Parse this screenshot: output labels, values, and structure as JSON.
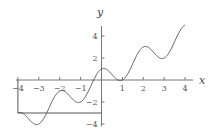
{
  "chart_data": {
    "type": "line",
    "title": "",
    "xlabel": "x",
    "ylabel": "y",
    "xlim": [
      -4,
      4
    ],
    "ylim": [
      -4,
      5
    ],
    "grid": false,
    "legend": null,
    "x_ticks": [
      "-4",
      "-3",
      "-2",
      "-1",
      "1",
      "2",
      "3",
      "4"
    ],
    "y_ticks": [
      "4",
      "2",
      "-2",
      "-4"
    ],
    "series": [
      {
        "name": "y = x + cos(πx)",
        "x": [
          -4,
          -3,
          -2,
          -1,
          0,
          1,
          2,
          3,
          4
        ],
        "values": [
          -3,
          -4,
          -1,
          -2,
          1,
          0,
          3,
          2,
          5
        ]
      }
    ],
    "annotations": [
      {
        "type": "polyline",
        "points": [
          [
            -4,
            0
          ],
          [
            -4,
            -3
          ],
          [
            0,
            -3
          ]
        ]
      }
    ],
    "colors": {
      "curve": "#555555",
      "axes": "#777777",
      "annotation": "#555555"
    }
  }
}
